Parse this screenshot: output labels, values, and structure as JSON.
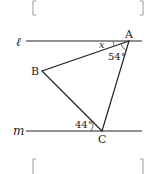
{
  "diagram": {
    "lines": {
      "top_label": "ℓ",
      "bottom_label": "m"
    },
    "vertices": {
      "A": "A",
      "B": "B",
      "C": "C"
    },
    "angles": {
      "unknown": "x",
      "at_A": "54°",
      "at_C": "44°"
    },
    "answer_boxes": [
      "",
      ""
    ]
  }
}
